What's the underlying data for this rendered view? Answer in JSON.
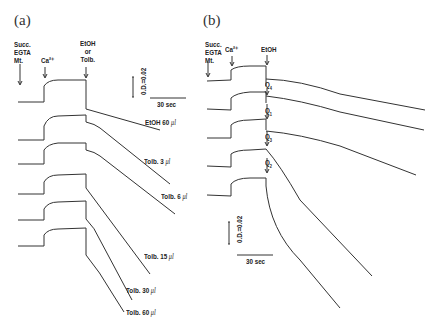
{
  "panels": {
    "a": {
      "label": "(a)",
      "additions": {
        "succ": "Succ.\nEGTA\nMt.",
        "ca": "Ca²⁺",
        "etoh_or_tolb": "EtOH\nor\nTolb."
      },
      "scale_bar": {
        "vertical": "0.D.=0.02",
        "horizontal": "30 sec"
      },
      "traces": [
        {
          "label": "EtOH 60",
          "unit": "μl"
        },
        {
          "label": "Tolb. 3",
          "unit": "μl"
        },
        {
          "label": "Tolb. 6",
          "unit": "μl"
        },
        {
          "label": "Tolb. 15",
          "unit": "μl"
        },
        {
          "label": "Tolb. 30",
          "unit": "μl"
        },
        {
          "label": "Tolb. 60",
          "unit": "μl"
        }
      ]
    },
    "b": {
      "label": "(b)",
      "additions": {
        "succ": "Succ.\nEGTA\nMt.",
        "ca": "Ca²⁺",
        "etoh": "EtOH"
      },
      "scale_bar": {
        "vertical": "0.D.=0.02",
        "horizontal": "30 sec"
      },
      "trace_markers": [
        {
          "q": "Q",
          "sub": "4"
        },
        {
          "q": "Q",
          "sub": "1"
        },
        {
          "q": "Q",
          "sub": "3"
        },
        {
          "q": "Q",
          "sub": "2"
        }
      ]
    }
  }
}
